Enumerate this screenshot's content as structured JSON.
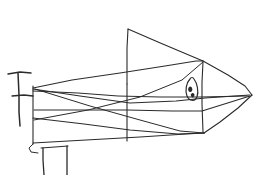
{
  "image": {
    "kind": "hand-drawn-pencil-sketch",
    "subject": "fish-or-submarine-with-sail-fin",
    "width": 273,
    "height": 175,
    "background_color": "#ffffff",
    "ink_color": "#2b2b2b",
    "stroke_width": 1.1,
    "caption": ""
  },
  "parts": {
    "sail_fin_label": "triangular sail fin",
    "body_label": "elongated body",
    "nose_label": "pointed nose",
    "eye_label": "eye",
    "mast_label": "T-shaped mast",
    "legs_label": "support legs"
  },
  "strokes": {
    "mast_vertical": "M 18 73 L 19 95 L 19 112 L 20 126",
    "mast_crossbar_top": "M 8 74 L 20 72 L 31 73",
    "mast_crossbar_mid": "M 12 96 L 24 95 L 33 96",
    "sail_left_edge": "M 128 29 L 127 48 L 127 66 L 127 84",
    "sail_top_slope": "M 128 29 L 158 42 L 184 53 L 203 61",
    "spine_vertical": "M 127 84 L 127 104 L 127 122 L 127 141",
    "body_top_edge": "M 33 88 L 72 80 L 120 73 L 165 66 L 196 61 L 203 61",
    "body_upper_sweep": "M 33 89 L 80 96 L 130 103 L 176 101 L 205 98 L 250 95",
    "body_mid_line": "M 33 91 L 78 93 L 118 96 L 160 97 L 200 97 L 247 96",
    "body_lower_sweep": "M 34 110 L 82 110 L 127 110 L 172 111 L 202 111 L 250 96",
    "nose_upper": "M 203 61 L 228 75 L 245 86 L 252 95",
    "nose_lower": "M 252 95 L 238 108 L 220 122 L 204 133",
    "belly_line": "M 33 118 L 84 124 L 130 130 L 178 134 L 204 133",
    "belly_outer": "M 33 143 L 86 140 L 140 137 L 186 134 L 204 133",
    "diagonal_cross_a": "M 35 89 L 90 106 L 140 120 L 180 131 L 204 133",
    "diagonal_cross_b": "M 34 120 L 88 110 L 140 97 L 182 80 L 203 62",
    "left_body_vertical": "M 33 86 L 33 106 L 33 125 L 33 144",
    "right_body_vertical": "M 203 62 L 202 82 L 202 104 L 203 132",
    "tail_hook": "M 33 144 L 29 148 L 31 152 L 38 153",
    "leg_left": "M 43 148 L 43 160 L 44 175",
    "leg_right": "M 67 146 L 67 160 L 67 175",
    "leg_top": "M 41 148 L 55 147 L 68 146",
    "eye_outline": "M 190 79 C 186 83 185 91 187 96 C 189 101 195 102 197 97 C 199 91 197 83 194 79 C 193 77 191 77 190 79 Z",
    "pupil_a": "M 190.2 86.5 a 2.1 2.8 0 1 0 0.1 0",
    "pupil_b": "M 192.6 93.0 a 1.8 2.2 0 1 0 0.1 0"
  }
}
